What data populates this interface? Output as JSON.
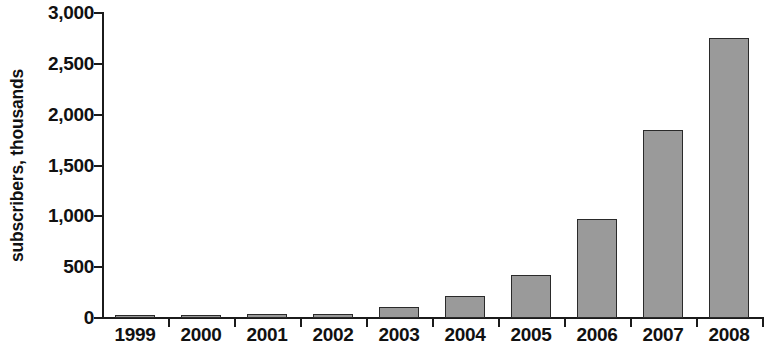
{
  "chart_data": {
    "type": "bar",
    "title": "",
    "subtitle": "",
    "xlabel": "",
    "ylabel": "subscribers, thousands",
    "categories": [
      "1999",
      "2000",
      "2001",
      "2002",
      "2003",
      "2004",
      "2005",
      "2006",
      "2007",
      "2008"
    ],
    "values": [
      20,
      30,
      35,
      35,
      110,
      215,
      420,
      970,
      1850,
      2750
    ],
    "series": [
      {
        "name": "subscribers",
        "values": [
          20,
          30,
          35,
          35,
          110,
          215,
          420,
          970,
          1850,
          2750
        ]
      }
    ],
    "ylim": [
      0,
      3000
    ],
    "ytick_values": [
      0,
      500,
      1000,
      1500,
      2000,
      2500,
      3000
    ],
    "ytick_labels": [
      "0",
      "500",
      "1,000",
      "1,500",
      "2,000",
      "2,500",
      "3,000"
    ],
    "grid": false,
    "legend": false,
    "legend_position": "none",
    "bar_color": "#9a9a9a",
    "bar_border_color": "#2a2a2a",
    "axis_color": "#1b1b1b",
    "background_color": "#ffffff",
    "text_color": "#111111",
    "annotations": []
  }
}
